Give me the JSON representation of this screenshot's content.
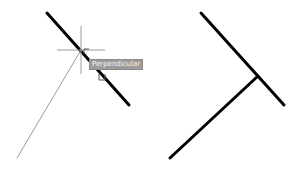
{
  "before": {
    "target_line": {
      "x1": 47,
      "y1": 13,
      "x2": 129,
      "y2": 105,
      "stroke": "#000000",
      "width": 3
    },
    "rubber_band_line": {
      "x1": 17,
      "y1": 158,
      "x2": 81,
      "y2": 50,
      "stroke": "#808080",
      "width": 0.8
    },
    "crosshair": {
      "x": 81,
      "y": 50,
      "size": 24,
      "color": "#9a9a9a"
    },
    "snap_marker": "perpendicular-snap-icon",
    "tooltip": {
      "label": "Perpendicular"
    }
  },
  "after": {
    "target_line": {
      "x1": 201,
      "y1": 13,
      "x2": 284,
      "y2": 105,
      "stroke": "#000000",
      "width": 3
    },
    "perpendicular_line": {
      "x1": 170,
      "y1": 158,
      "x2": 258,
      "y2": 76,
      "stroke": "#000000",
      "width": 3
    }
  }
}
